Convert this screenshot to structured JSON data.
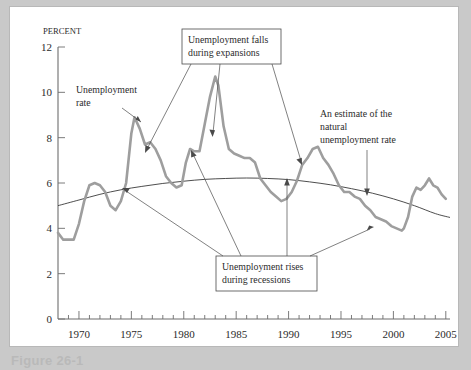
{
  "figure": {
    "caption": "Figure 26-1",
    "panel_background": "#ffffff",
    "page_background": "#c9c9c9"
  },
  "colors": {
    "unemployment_line": "#9e9e9e",
    "natural_rate_line": "#3a3a3a",
    "axis": "#6d6d6d",
    "text": "#2b2b2b",
    "callout_border": "#4a4a4a"
  },
  "chart_data": {
    "type": "line",
    "title": "",
    "xlabel": "",
    "ylabel": "Percent",
    "ylabel_display": "PERCENT",
    "xlim": [
      1968,
      2005.4
    ],
    "ylim": [
      0,
      12
    ],
    "yticks": [
      0,
      2,
      4,
      6,
      8,
      10,
      12
    ],
    "ytick_labels": [
      "0",
      "2",
      "4",
      "6",
      "8",
      "10",
      "12"
    ],
    "xticks": [
      1970,
      1975,
      1980,
      1985,
      1990,
      1995,
      2000,
      2005
    ],
    "xtick_labels": [
      "1970",
      "1975",
      "1980",
      "1985",
      "1990",
      "1995",
      "2000",
      "2005"
    ],
    "x_minor_tick_interval": 1,
    "grid": false,
    "legend_position": "none",
    "series": [
      {
        "name": "Unemployment rate",
        "color": "#9e9e9e",
        "x": [
          1968.0,
          1968.5,
          1969.0,
          1969.5,
          1970.0,
          1970.5,
          1971.0,
          1971.5,
          1972.0,
          1972.5,
          1973.0,
          1973.5,
          1974.0,
          1974.5,
          1975.0,
          1975.3,
          1975.8,
          1976.3,
          1976.8,
          1977.3,
          1977.8,
          1978.3,
          1978.8,
          1979.3,
          1979.8,
          1980.2,
          1980.6,
          1981.0,
          1981.5,
          1982.0,
          1982.5,
          1983.0,
          1983.3,
          1983.8,
          1984.3,
          1984.8,
          1985.3,
          1985.8,
          1986.3,
          1986.8,
          1987.3,
          1987.8,
          1988.3,
          1988.8,
          1989.3,
          1989.8,
          1990.3,
          1990.8,
          1991.3,
          1991.8,
          1992.3,
          1992.8,
          1993.3,
          1993.8,
          1994.3,
          1994.8,
          1995.3,
          1995.8,
          1996.3,
          1996.8,
          1997.3,
          1997.8,
          1998.3,
          1998.8,
          1999.3,
          1999.8,
          2000.3,
          2000.8,
          2001.0,
          2001.4,
          2001.8,
          2002.2,
          2002.6,
          2003.0,
          2003.4,
          2003.8,
          2004.2,
          2004.6,
          2005.0
        ],
        "y": [
          3.8,
          3.5,
          3.5,
          3.5,
          4.2,
          5.2,
          5.9,
          6.0,
          5.9,
          5.6,
          5.0,
          4.8,
          5.2,
          6.0,
          8.2,
          8.9,
          8.4,
          7.7,
          7.8,
          7.5,
          7.0,
          6.3,
          6.0,
          5.8,
          5.9,
          6.9,
          7.5,
          7.4,
          7.4,
          8.6,
          9.8,
          10.7,
          10.3,
          8.5,
          7.5,
          7.3,
          7.2,
          7.1,
          7.1,
          6.9,
          6.2,
          5.9,
          5.6,
          5.4,
          5.2,
          5.3,
          5.6,
          6.1,
          6.8,
          7.1,
          7.5,
          7.6,
          7.1,
          6.8,
          6.4,
          5.9,
          5.6,
          5.6,
          5.4,
          5.3,
          5.0,
          4.8,
          4.5,
          4.4,
          4.3,
          4.1,
          4.0,
          3.9,
          4.0,
          4.5,
          5.4,
          5.8,
          5.7,
          5.9,
          6.2,
          5.9,
          5.8,
          5.5,
          5.3
        ]
      },
      {
        "name": "An estimate of the natural unemployment rate",
        "color": "#3a3a3a",
        "x": [
          1968,
          1970,
          1972,
          1974,
          1976,
          1978,
          1980,
          1982,
          1984,
          1986,
          1988,
          1990,
          1992,
          1994,
          1996,
          1998,
          2000,
          2002,
          2004,
          2005.4
        ],
        "y": [
          5.0,
          5.25,
          5.5,
          5.7,
          5.85,
          5.98,
          6.08,
          6.16,
          6.2,
          6.22,
          6.2,
          6.15,
          6.05,
          5.92,
          5.75,
          5.55,
          5.3,
          5.0,
          4.65,
          4.48
        ]
      }
    ],
    "annotations": [
      {
        "id": "unemployment-rate-label",
        "text_lines": [
          "Unemployment",
          "rate"
        ],
        "kind": "plain-text",
        "points_to": "unemployment rate series near 1975 peak"
      },
      {
        "id": "natural-rate-label",
        "text_lines": [
          "An estimate of the",
          "natural",
          "unemployment rate"
        ],
        "kind": "plain-text",
        "points_to": "natural unemployment rate curve near 1998"
      },
      {
        "id": "expansions-callout",
        "text_lines": [
          "Unemployment falls",
          "during expansions"
        ],
        "kind": "boxed",
        "points_to": "downward-sloping segments of the unemployment rate after 1976, 1983 and 1992"
      },
      {
        "id": "recessions-callout",
        "text_lines": [
          "Unemployment rises",
          "during recessions"
        ],
        "kind": "boxed",
        "points_to": "upward-sloping segments of the unemployment rate in 1975, 1981, 1990 and 2001"
      }
    ]
  }
}
